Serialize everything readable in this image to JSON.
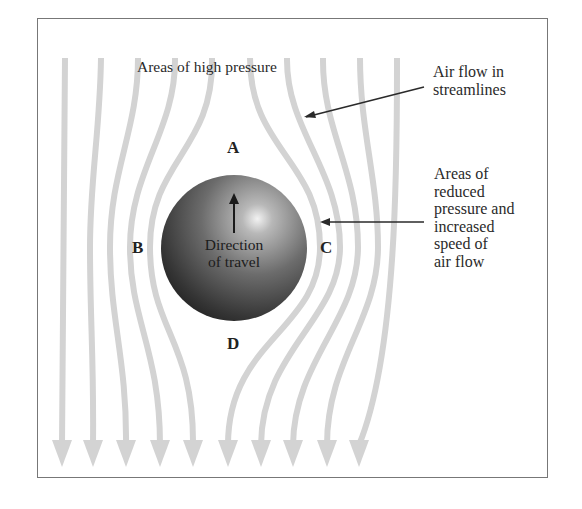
{
  "diagram": {
    "type": "streamline-flow-around-sphere",
    "labels": {
      "high_pressure": "Areas of high pressure",
      "air_flow": "Air flow in\nstreamlines",
      "reduced_pressure": "Areas of\nreduced\npressure and\nincreased\nspeed of\nair flow",
      "direction": "Direction\nof travel",
      "point_a": "A",
      "point_b": "B",
      "point_c": "C",
      "point_d": "D"
    },
    "streamline_count": 10,
    "colors": {
      "streamline": "#d3d3d3",
      "frame": "#777777",
      "text": "#2a2a2a",
      "sphere_dark": "#1e1e1e",
      "sphere_light": "#e8e8e8"
    }
  }
}
